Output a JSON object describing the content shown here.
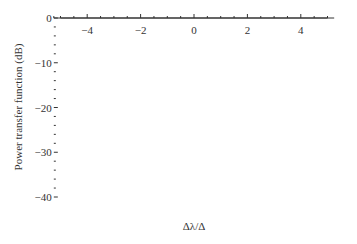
{
  "chart_data": {
    "type": "line",
    "title": "",
    "xlabel": "Δλ/Δ",
    "ylabel": "Power transfer function (dB)",
    "xlim": [
      -5.25,
      5.25
    ],
    "ylim": [
      -40,
      0
    ],
    "x_ticks": [
      -4,
      -2,
      0,
      2,
      4
    ],
    "x_tick_labels": [
      "−4",
      "−2",
      "0",
      "2",
      "4"
    ],
    "y_ticks": [
      0,
      -10,
      -20,
      -30,
      -40
    ],
    "y_tick_labels": [
      "0",
      "−10",
      "−20",
      "−30",
      "−40"
    ],
    "grid": false,
    "legend": null,
    "lobes": [
      {
        "x_start": -5.0,
        "x_end": -4.0,
        "peak_x": -4.47,
        "peak_db": -19.0
      },
      {
        "x_start": -4.0,
        "x_end": -3.0,
        "peak_x": -3.47,
        "peak_db": -16.8
      },
      {
        "x_start": -3.0,
        "x_end": -2.0,
        "peak_x": -2.46,
        "peak_db": -13.8
      },
      {
        "x_start": -2.0,
        "x_end": -1.0,
        "peak_x": -1.43,
        "peak_db": -9.3
      },
      {
        "x_start": -1.0,
        "x_end": 1.0,
        "peak_x": 0,
        "peak_db": 0
      },
      {
        "x_start": 1.0,
        "x_end": 2.0,
        "peak_x": 1.43,
        "peak_db": -9.3
      },
      {
        "x_start": 2.0,
        "x_end": 3.0,
        "peak_x": 2.46,
        "peak_db": -13.8
      },
      {
        "x_start": 3.0,
        "x_end": 4.0,
        "peak_x": 3.47,
        "peak_db": -16.8
      },
      {
        "x_start": 4.0,
        "x_end": 5.0,
        "peak_x": 4.47,
        "peak_db": -19.0
      }
    ]
  }
}
